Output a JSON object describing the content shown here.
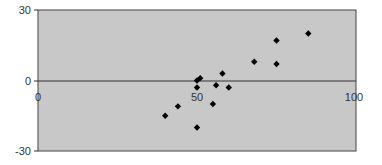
{
  "chart_data": {
    "type": "scatter",
    "title": "",
    "xlabel": "",
    "ylabel": "",
    "xlim": [
      0,
      100
    ],
    "ylim": [
      -30,
      30
    ],
    "x_ticks": [
      "0",
      "50",
      "100"
    ],
    "y_ticks": [
      "30",
      "0",
      "-30"
    ],
    "grid": false,
    "legend": null,
    "background": "#c8c8c8",
    "marker": "diamond",
    "marker_color": "#000000",
    "points": [
      {
        "x": 40,
        "y": -15
      },
      {
        "x": 44,
        "y": -11
      },
      {
        "x": 50,
        "y": -20
      },
      {
        "x": 50,
        "y": -3
      },
      {
        "x": 50,
        "y": 0
      },
      {
        "x": 51,
        "y": 1
      },
      {
        "x": 55,
        "y": -10
      },
      {
        "x": 56,
        "y": -2
      },
      {
        "x": 58,
        "y": 3
      },
      {
        "x": 60,
        "y": -3
      },
      {
        "x": 68,
        "y": 8
      },
      {
        "x": 75,
        "y": 7
      },
      {
        "x": 75,
        "y": 17
      },
      {
        "x": 85,
        "y": 20
      }
    ]
  }
}
